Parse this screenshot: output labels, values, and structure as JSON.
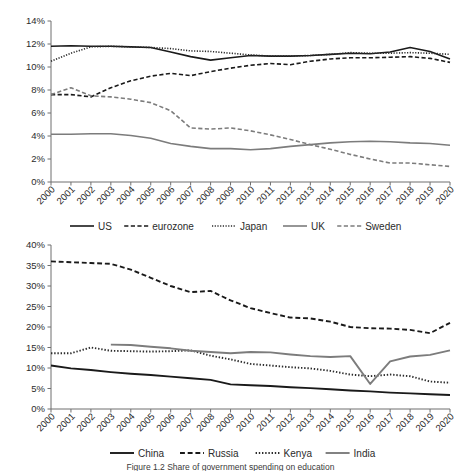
{
  "figure": {
    "caption": "Figure 1.2  Share of government spending on education"
  },
  "chart_data": [
    {
      "id": "upper",
      "type": "line",
      "title": "",
      "xlabel": "",
      "ylabel": "",
      "x": [
        "2000",
        "2001",
        "2002",
        "2003",
        "2004",
        "2005",
        "2006",
        "2007",
        "2008",
        "2009",
        "2010",
        "2011",
        "2012",
        "2013",
        "2014",
        "2015",
        "2016",
        "2017",
        "2018",
        "2019",
        "2020"
      ],
      "ylim": [
        0,
        14
      ],
      "yticks": [
        "0%",
        "2%",
        "4%",
        "6%",
        "8%",
        "10%",
        "12%",
        "14%"
      ],
      "ytickvals": [
        0,
        2,
        4,
        6,
        8,
        10,
        12,
        14
      ],
      "grid": false,
      "legend_position": "bottom",
      "series": [
        {
          "name": "US",
          "style": "solid",
          "color": "#1a1a1a",
          "width": 1.6,
          "values": [
            11.8,
            11.85,
            11.8,
            11.8,
            11.75,
            11.7,
            11.3,
            10.9,
            10.6,
            10.8,
            11.0,
            10.95,
            10.95,
            11.0,
            11.1,
            11.2,
            11.15,
            11.3,
            11.7,
            11.35,
            10.7
          ]
        },
        {
          "name": "eurozone",
          "style": "dashed",
          "color": "#1a1a1a",
          "width": 1.6,
          "values": [
            7.6,
            7.6,
            7.4,
            8.2,
            8.8,
            9.2,
            9.45,
            9.25,
            9.6,
            9.9,
            10.15,
            10.3,
            10.2,
            10.5,
            10.7,
            10.8,
            10.8,
            10.85,
            10.9,
            10.75,
            10.4
          ]
        },
        {
          "name": "Japan",
          "style": "dotted",
          "color": "#2b2b2b",
          "width": 1.6,
          "values": [
            10.5,
            11.2,
            11.75,
            11.8,
            11.75,
            11.7,
            11.6,
            11.4,
            11.35,
            11.2,
            11.05,
            10.95,
            10.95,
            11.0,
            11.1,
            11.25,
            11.2,
            11.2,
            11.25,
            11.2,
            11.1
          ]
        },
        {
          "name": "UK",
          "style": "solid",
          "color": "#7c7c7c",
          "width": 1.6,
          "values": [
            4.15,
            4.15,
            4.2,
            4.2,
            4.05,
            3.8,
            3.35,
            3.1,
            2.9,
            2.9,
            2.8,
            2.9,
            3.1,
            3.25,
            3.4,
            3.5,
            3.55,
            3.5,
            3.4,
            3.35,
            3.2
          ]
        },
        {
          "name": "Sweden",
          "style": "dashed",
          "color": "#7c7c7c",
          "width": 1.6,
          "values": [
            7.6,
            8.2,
            7.5,
            7.4,
            7.2,
            6.9,
            6.2,
            4.7,
            4.6,
            4.7,
            4.45,
            4.1,
            3.7,
            3.25,
            2.85,
            2.4,
            2.0,
            1.65,
            1.65,
            1.5,
            1.35
          ]
        }
      ]
    },
    {
      "id": "lower",
      "type": "line",
      "title": "",
      "xlabel": "",
      "ylabel": "",
      "x": [
        "2000",
        "2001",
        "2002",
        "2003",
        "2004",
        "2005",
        "2006",
        "2007",
        "2008",
        "2009",
        "2010",
        "2011",
        "2012",
        "2013",
        "2014",
        "2015",
        "2016",
        "2017",
        "2018",
        "2019",
        "2020"
      ],
      "ylim": [
        0,
        40
      ],
      "yticks": [
        "0%",
        "5%",
        "10%",
        "15%",
        "20%",
        "25%",
        "30%",
        "35%",
        "40%"
      ],
      "ytickvals": [
        0,
        5,
        10,
        15,
        20,
        25,
        30,
        35,
        40
      ],
      "grid": false,
      "legend_position": "bottom",
      "series": [
        {
          "name": "China",
          "style": "solid",
          "color": "#1a1a1a",
          "width": 1.9,
          "values": [
            10.6,
            9.9,
            9.5,
            9.0,
            8.6,
            8.3,
            7.9,
            7.5,
            7.1,
            6.0,
            5.8,
            5.6,
            5.3,
            5.1,
            4.8,
            4.5,
            4.3,
            4.0,
            3.8,
            3.6,
            3.4
          ]
        },
        {
          "name": "Russia",
          "style": "dashed",
          "color": "#1a1a1a",
          "width": 1.9,
          "values": [
            36.0,
            35.8,
            35.6,
            35.4,
            34.0,
            32.0,
            30.0,
            28.5,
            28.8,
            26.5,
            24.6,
            23.4,
            22.3,
            22.1,
            21.3,
            20.0,
            19.7,
            19.6,
            19.3,
            18.5,
            21.0
          ]
        },
        {
          "name": "Kenya",
          "style": "dotted",
          "color": "#2b2b2b",
          "width": 1.9,
          "values": [
            13.6,
            13.6,
            15.0,
            14.2,
            14.1,
            14.0,
            14.1,
            14.3,
            13.0,
            12.1,
            11.0,
            10.6,
            10.2,
            9.9,
            9.3,
            8.4,
            8.0,
            8.4,
            8.0,
            6.7,
            6.4
          ]
        },
        {
          "name": "India",
          "style": "solid",
          "color": "#7c7c7c",
          "width": 1.9,
          "values": [
            null,
            null,
            null,
            15.7,
            15.6,
            15.2,
            14.8,
            14.2,
            13.9,
            13.6,
            13.9,
            13.8,
            13.3,
            12.9,
            12.7,
            12.9,
            6.1,
            11.6,
            12.8,
            13.2,
            14.3
          ]
        }
      ]
    }
  ]
}
